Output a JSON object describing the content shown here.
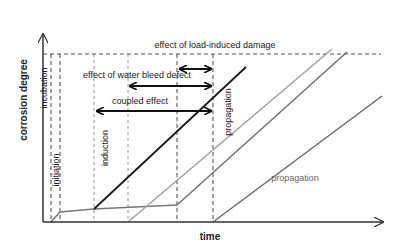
{
  "diagram": {
    "axes": {
      "x_label": "time",
      "y_label": "corrosion degree"
    },
    "phases": {
      "incubation": "incubation",
      "initiation": "initiation",
      "induction": "induction",
      "propagation_vertical": "propagation",
      "propagation_horizontal": "propagation"
    },
    "effects": {
      "load_induced": "effect of load-induced damage",
      "water_bleed": "effect of water bleed defect",
      "coupled": "coupled effect"
    },
    "colors": {
      "black_line": "#1a1a1a",
      "light_gray_line": "#a0a0a0",
      "mid_gray_line": "#707070",
      "dark_gray_line": "#6a6a6a",
      "dashed": "#444444"
    }
  }
}
